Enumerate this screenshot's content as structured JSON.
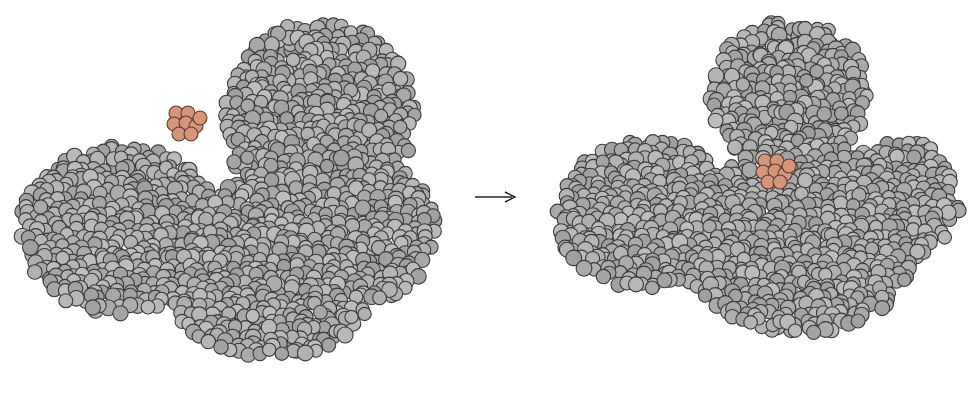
{
  "figure": {
    "colors": {
      "protein_fill": "#a9a9a9",
      "protein_stroke": "#3a3a3a",
      "ligand_fill": "#d4957a",
      "ligand_stroke": "#5a3a2e",
      "arrow": "#222222",
      "background": "#ffffff"
    },
    "left_panel": {
      "label": "unbound protein with free ligand",
      "protein_blobs": [
        {
          "cx": 320,
          "cy": 120,
          "rx": 95,
          "ry": 100
        },
        {
          "cx": 120,
          "cy": 230,
          "rx": 100,
          "ry": 85
        },
        {
          "cx": 270,
          "cy": 270,
          "rx": 110,
          "ry": 90
        },
        {
          "cx": 370,
          "cy": 230,
          "rx": 65,
          "ry": 70
        }
      ],
      "ligand": {
        "cx": 183,
        "cy": 124
      }
    },
    "arrow": {
      "x1": 475,
      "y1": 197,
      "x2": 515,
      "y2": 197,
      "glyph": "→"
    },
    "right_panel": {
      "label": "closed protein with bound ligand",
      "protein_blobs": [
        {
          "cx": 790,
          "cy": 95,
          "rx": 80,
          "ry": 75
        },
        {
          "cx": 650,
          "cy": 215,
          "rx": 95,
          "ry": 75
        },
        {
          "cx": 800,
          "cy": 240,
          "rx": 120,
          "ry": 95
        },
        {
          "cx": 900,
          "cy": 200,
          "rx": 60,
          "ry": 60
        }
      ],
      "ligand": {
        "cx": 772,
        "cy": 172
      }
    }
  }
}
